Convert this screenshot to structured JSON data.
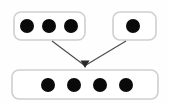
{
  "diagram": {
    "type": "set-union-diagram",
    "canvas": {
      "width": 169,
      "height": 103,
      "background": "#fefefe"
    },
    "style": {
      "box_fill": "#ffffff",
      "box_stroke": "#cfcfcf",
      "box_stroke_width": 1.6,
      "box_corner_radius": 7,
      "dot_color": "#0a0a0a",
      "dot_radius": 7,
      "arrow_color": "#4a4a4a",
      "arrow_stroke_width": 1.1
    },
    "boxes": [
      {
        "id": "source-box-left",
        "label": "left source set",
        "x": 14,
        "y": 12,
        "width": 71,
        "height": 28,
        "dot_count": 3,
        "dots": [
          {
            "cx": 27,
            "cy": 26
          },
          {
            "cx": 49,
            "cy": 26
          },
          {
            "cx": 71,
            "cy": 26
          }
        ]
      },
      {
        "id": "source-box-right",
        "label": "right source set",
        "x": 113,
        "y": 12,
        "width": 43,
        "height": 28,
        "dot_count": 1,
        "dots": [
          {
            "cx": 133,
            "cy": 26
          }
        ]
      },
      {
        "id": "result-box",
        "label": "result set",
        "x": 12,
        "y": 70,
        "width": 146,
        "height": 29,
        "dot_count": 4,
        "dots": [
          {
            "cx": 48,
            "cy": 85
          },
          {
            "cx": 74,
            "cy": 85
          },
          {
            "cx": 100,
            "cy": 85
          },
          {
            "cx": 126,
            "cy": 85
          }
        ]
      }
    ],
    "arrows": [
      {
        "id": "arrow-left-to-result",
        "label": "left source to result",
        "x1": 52,
        "y1": 41,
        "x2": 84,
        "y2": 65
      },
      {
        "id": "arrow-right-to-result",
        "label": "right source to result",
        "x1": 126,
        "y1": 41,
        "x2": 86,
        "y2": 65
      }
    ],
    "arrow_convergence_point": {
      "x": 85,
      "y": 65
    }
  }
}
